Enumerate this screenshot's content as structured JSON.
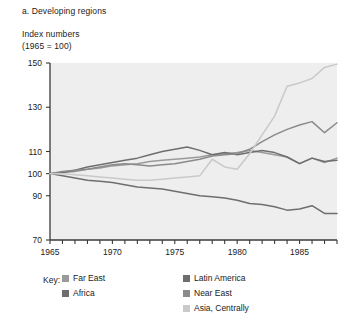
{
  "caption": "a. Developing regions",
  "axis_title": {
    "line1": "Index numbers",
    "line2": "(1965 = 100)"
  },
  "key": {
    "label": "Key:"
  },
  "colors": {
    "far_east": "#9a9a9a",
    "africa": "#6e6e6e",
    "latin_america": "#6e6e6e",
    "near_east": "#8a8a8a",
    "asia_centrally": "#c9c9c9",
    "plot_bg": "#eeeeee",
    "axis": "#3a3a3a",
    "text": "#1b1b1b"
  },
  "chart_data": {
    "type": "line",
    "title": "a. Developing regions",
    "subtitle": "Index numbers (1965 = 100)",
    "xlabel": "",
    "ylabel": "Index numbers (1965 = 100)",
    "xlim": [
      1965,
      1988
    ],
    "ylim": [
      70,
      150
    ],
    "yticks": [
      70,
      90,
      100,
      110,
      130,
      150
    ],
    "ytick_labels": [
      "70",
      "90",
      "100",
      "110",
      "130",
      "150"
    ],
    "xticks": [
      1965,
      1966,
      1967,
      1968,
      1969,
      1970,
      1971,
      1972,
      1973,
      1974,
      1975,
      1976,
      1977,
      1978,
      1979,
      1980,
      1981,
      1982,
      1983,
      1984,
      1985,
      1986,
      1987,
      1988
    ],
    "xtick_labels": [
      "1965",
      "1970",
      "1975",
      "1980",
      "1985"
    ],
    "xtick_label_years": [
      1965,
      1970,
      1975,
      1980,
      1985
    ],
    "grid": false,
    "legend_position": "below",
    "x": [
      1965,
      1966,
      1967,
      1968,
      1969,
      1970,
      1971,
      1972,
      1973,
      1974,
      1975,
      1976,
      1977,
      1978,
      1979,
      1980,
      1981,
      1982,
      1983,
      1984,
      1985,
      1986,
      1987,
      1988
    ],
    "series": [
      {
        "name": "Far East",
        "color": "#9a9a9a",
        "values": [
          100,
          100.5,
          101,
          102,
          102.5,
          103.5,
          104,
          104.5,
          105.5,
          106,
          106.5,
          107,
          107.5,
          108.5,
          109,
          109.5,
          110.5,
          109.5,
          108.5,
          107.5,
          104.5,
          107,
          105,
          107
        ]
      },
      {
        "name": "Africa",
        "color": "#6e6e6e",
        "values": [
          100,
          99,
          98,
          97,
          96.5,
          96,
          95,
          94,
          93.5,
          93,
          92,
          91,
          90,
          89.5,
          89,
          88,
          86.5,
          86,
          85,
          83.5,
          84,
          85.5,
          82,
          82
        ]
      },
      {
        "name": "Latin America",
        "color": "#6e6e6e",
        "values": [
          100,
          100.5,
          101.5,
          103,
          104,
          105,
          106,
          107,
          108.5,
          110,
          111,
          112,
          110.5,
          108.5,
          109.5,
          108.5,
          109.5,
          110.5,
          109.5,
          107.5,
          104.5,
          107,
          105.5,
          106
        ]
      },
      {
        "name": "Near East",
        "color": "#8a8a8a",
        "values": [
          100,
          101,
          101.5,
          102,
          103,
          104,
          104.5,
          104,
          103.5,
          104,
          104.5,
          105.5,
          106.5,
          108,
          108.5,
          109,
          111,
          114.5,
          117.5,
          120,
          122,
          123.5,
          118.5,
          123
        ]
      },
      {
        "name": "Asia, Centrally",
        "color": "#c9c9c9",
        "values": [
          100,
          100,
          99.5,
          99,
          98.5,
          98,
          97.5,
          97,
          97,
          97.5,
          98,
          98.5,
          99,
          106.5,
          103,
          102,
          109,
          117.5,
          126,
          139.5,
          141,
          143,
          148,
          149.5
        ]
      }
    ]
  },
  "legend": [
    {
      "label": "Far East",
      "color": "#9a9a9a",
      "col": 0,
      "row": 0
    },
    {
      "label": "Africa",
      "color": "#6e6e6e",
      "col": 0,
      "row": 1
    },
    {
      "label": "Latin America",
      "color": "#6e6e6e",
      "col": 1,
      "row": 0
    },
    {
      "label": "Near East",
      "color": "#8a8a8a",
      "col": 1,
      "row": 1
    },
    {
      "label": "Asia, Centrally",
      "color": "#c9c9c9",
      "col": 1,
      "row": 2
    }
  ]
}
